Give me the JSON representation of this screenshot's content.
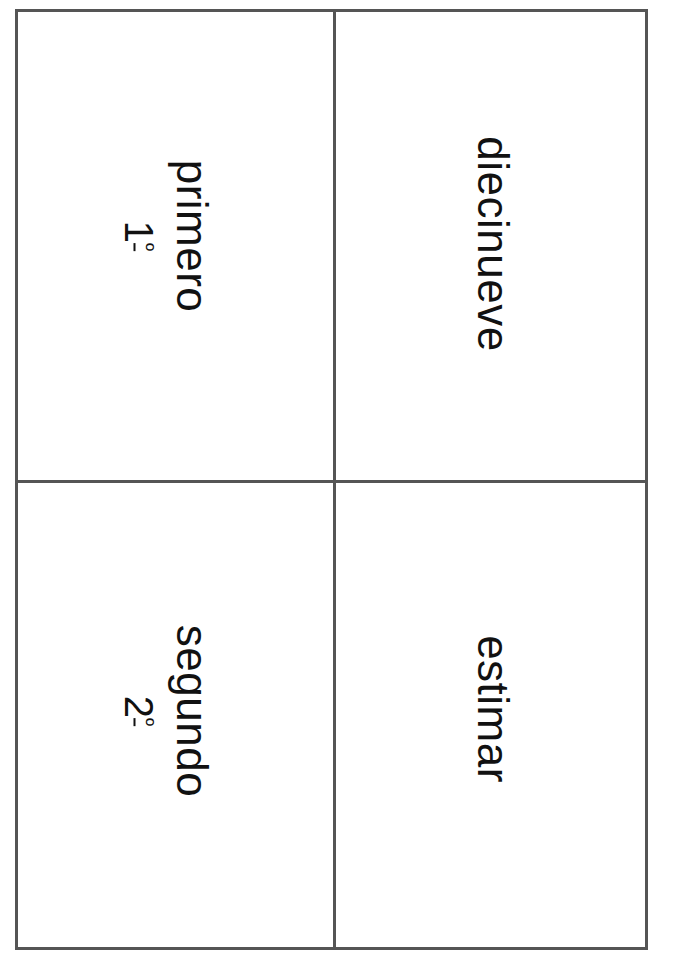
{
  "document": {
    "type": "vocabulary-cards",
    "orientation": "text rotated 90deg clockwise",
    "grid": {
      "rows": 2,
      "columns": 2
    },
    "line_color": "#555555"
  },
  "cards": [
    {
      "position": "top-left",
      "word": "primero",
      "ordinal_number": "1",
      "ordinal_suffix": "º"
    },
    {
      "position": "top-right",
      "word": "diecinueve"
    },
    {
      "position": "bottom-left",
      "word": "segundo",
      "ordinal_number": "2",
      "ordinal_suffix": "º"
    },
    {
      "position": "bottom-right",
      "word": "estimar"
    }
  ]
}
